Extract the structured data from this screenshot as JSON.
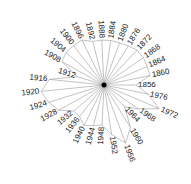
{
  "chart_data": {
    "type": "radar",
    "title": "",
    "center": [
      104,
      85
    ],
    "start_angle_deg": 0,
    "direction": "counterclockwise",
    "categories": [
      "1856",
      "1860",
      "1864",
      "1868",
      "1872",
      "1876",
      "1880",
      "1884",
      "1888",
      "1892",
      "1896",
      "1900",
      "1904",
      "1908",
      "1912",
      "1916",
      "1920",
      "1924",
      "1928",
      "1932",
      "1936",
      "1940",
      "1944",
      "1948",
      "1952",
      "1956",
      "1960",
      "1964",
      "1968",
      "1972",
      "1976"
    ],
    "values": [
      32,
      47,
      47,
      48,
      48,
      46,
      45,
      45,
      45,
      45,
      50,
      50,
      50,
      48,
      28,
      55,
      63,
      58,
      52,
      40,
      40,
      45,
      42,
      40,
      50,
      62,
      50,
      30,
      42,
      60,
      45
    ],
    "grid": false,
    "legend": "none",
    "colors": {
      "spoke": "#9a9a9a",
      "outline": "#9a9a9a",
      "hub": "#000000",
      "label": "#222222"
    }
  }
}
